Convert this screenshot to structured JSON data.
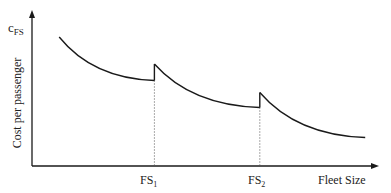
{
  "chart_data": {
    "type": "line",
    "title": "",
    "ylabel": "Cost per passenger",
    "y_symbol": "c",
    "y_symbol_sub": "FS",
    "xlabel": "Fleet Size",
    "x_ticks": [
      {
        "base": "FS",
        "sub": "1"
      },
      {
        "base": "FS",
        "sub": "2"
      }
    ],
    "segments": [
      {
        "name": "segment-1",
        "x_range": [
          0.08,
          0.36
        ],
        "y_start": 0.86,
        "y_end": 0.57
      },
      {
        "name": "segment-2",
        "x_range": [
          0.36,
          0.67
        ],
        "y_start": 0.68,
        "y_end": 0.39
      },
      {
        "name": "segment-3",
        "x_range": [
          0.67,
          0.98
        ],
        "y_start": 0.49,
        "y_end": 0.19
      }
    ],
    "breakpoints": [
      "FS1",
      "FS2"
    ],
    "grid": false,
    "legend": "none",
    "colors": {
      "curve": "#1a1a1a",
      "axis": "#1a1a1a",
      "dotted": "#555555"
    }
  }
}
